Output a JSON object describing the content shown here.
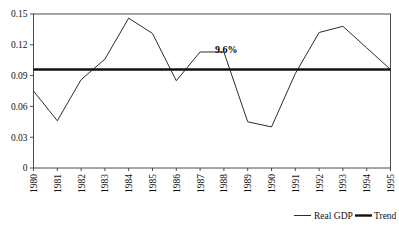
{
  "chart_data": {
    "type": "line",
    "title": "",
    "subtitle": "",
    "xlabel": "",
    "ylabel": "",
    "x": [
      1980,
      1981,
      1982,
      1983,
      1984,
      1985,
      1986,
      1987,
      1988,
      1989,
      1990,
      1991,
      1992,
      1993,
      1994,
      1995
    ],
    "categories": [
      "1980",
      "1981",
      "1982",
      "1983",
      "1984",
      "1985",
      "1986",
      "1987",
      "1988",
      "1989",
      "1990",
      "1991",
      "1992",
      "1993",
      "1994",
      "1995"
    ],
    "series": [
      {
        "name": "Real GDP",
        "values": [
          0.075,
          0.046,
          0.086,
          0.106,
          0.146,
          0.131,
          0.085,
          0.113,
          0.113,
          0.045,
          0.04,
          0.092,
          0.132,
          0.138,
          0.117,
          0.096
        ]
      },
      {
        "name": "Trend",
        "values": [
          0.096,
          0.096,
          0.096,
          0.096,
          0.096,
          0.096,
          0.096,
          0.096,
          0.096,
          0.096,
          0.096,
          0.096,
          0.096,
          0.096,
          0.096,
          0.096
        ]
      }
    ],
    "ylim": [
      0,
      0.15
    ],
    "xlim": [
      1980,
      1995
    ],
    "yticks": [
      0,
      0.03,
      0.06,
      0.09,
      0.12,
      0.15
    ],
    "ytick_labels": [
      "0",
      "0.03",
      "0.06",
      "0.09",
      "0.12",
      "0.15"
    ],
    "grid": false,
    "legend_position": "bottom-right",
    "annotations": [
      {
        "name": "trend-value-label",
        "text": "9.6%",
        "x": 1988.1,
        "y": 0.112
      }
    ]
  },
  "legend": {
    "entries": [
      {
        "label": "Real GDP",
        "color": "#2b2b2b",
        "style": "thin-line"
      },
      {
        "label": "Trend",
        "color": "#111111",
        "style": "thick-line"
      }
    ]
  },
  "colors": {
    "background": "#ffffff",
    "axis": "#4a4a4a",
    "series_real_gdp": "#2b2b2b",
    "series_trend": "#111111",
    "text": "#111111"
  }
}
